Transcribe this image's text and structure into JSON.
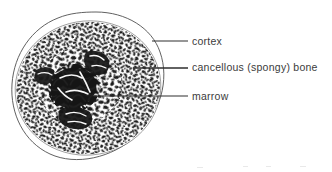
{
  "figure": {
    "colors": {
      "ink": "#1a1a1a",
      "text": "#3b3b3b",
      "outline": "#4a4a4a",
      "background": "#ffffff",
      "trabecula": "#262626",
      "marrow_dark": "#141414"
    }
  },
  "labels": [
    {
      "id": "cortex",
      "text": "cortex",
      "leader": {
        "x1": 152,
        "y1": 41,
        "x2": 188,
        "y2": 41
      }
    },
    {
      "id": "cancellous",
      "text": "cancellous (spongy) bone",
      "leader": {
        "x1": 133,
        "y1": 68,
        "x2": 188,
        "y2": 68
      }
    },
    {
      "id": "marrow",
      "text": "marrow",
      "leader": {
        "x1": 94,
        "y1": 96,
        "x2": 188,
        "y2": 96
      }
    }
  ],
  "regions": {
    "cortex_label": "cortex",
    "cancellous_label": "cancellous (spongy) bone",
    "marrow_label": "marrow"
  }
}
